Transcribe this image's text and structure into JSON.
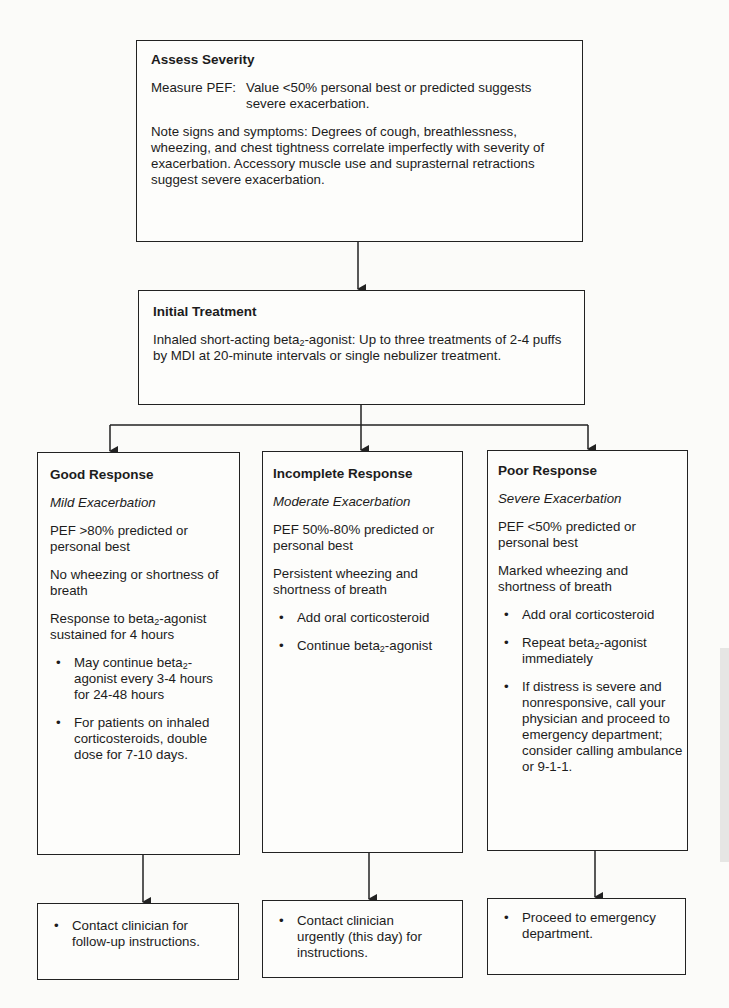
{
  "assess": {
    "title": "Assess Severity",
    "measure_label": "Measure PEF:",
    "measure_text": "Value <50% personal best or predicted suggests severe exacerbation.",
    "signs_text": "Note signs and symptoms:  Degrees of cough, breathlessness, wheezing, and chest tightness correlate imperfectly with severity of exacerbation.  Accessory muscle use and suprasternal retractions suggest severe exacerbation."
  },
  "initial": {
    "title": "Initial Treatment",
    "text_pre": "Inhaled short-acting beta",
    "text_sub": "2",
    "text_post": "-agonist:  Up to three treatments of 2-4 puffs by MDI at 20-minute intervals or single nebulizer treatment."
  },
  "responses": [
    {
      "title": "Good Response",
      "severity": "Mild Exacerbation",
      "pef": "PEF >80% predicted or personal best",
      "symptoms": "No wheezing or shortness of breath",
      "extra_pre": "Response to beta",
      "extra_sub": "2",
      "extra_post": "-agonist sustained for 4 hours",
      "bullets": [
        {
          "pre": "May continue beta",
          "sub": "2",
          "post": "-agonist every 3-4 hours for 24-48 hours"
        },
        {
          "pre": "For patients on inhaled corticosteroids, double dose for 7-10 days.",
          "sub": "",
          "post": ""
        }
      ],
      "action": "Contact clinician for follow-up instructions."
    },
    {
      "title": "Incomplete Response",
      "severity": "Moderate Exacerbation",
      "pef": "PEF 50%-80% predicted or personal best",
      "symptoms": "Persistent wheezing and shortness of breath",
      "bullets": [
        {
          "pre": "Add oral corticosteroid",
          "sub": "",
          "post": ""
        },
        {
          "pre": "Continue beta",
          "sub": "2",
          "post": "-agonist"
        }
      ],
      "action": "Contact clinician urgently (this day) for instructions."
    },
    {
      "title": "Poor Response",
      "severity": "Severe Exacerbation",
      "pef": "PEF <50% predicted or personal best",
      "symptoms": "Marked wheezing and shortness of breath",
      "bullets": [
        {
          "pre": "Add oral corticosteroid",
          "sub": "",
          "post": ""
        },
        {
          "pre": "Repeat beta",
          "sub": "2",
          "post": "-agonist immediately"
        },
        {
          "pre": "If distress is severe and nonresponsive, call your physician and proceed to emergency department; consider calling ambulance or 9-1-1.",
          "sub": "",
          "post": ""
        }
      ],
      "action": "Proceed to emergency department."
    }
  ],
  "bullet_glyph": "•",
  "colors": {
    "line": "#222222",
    "background": "#fbfbf9"
  }
}
